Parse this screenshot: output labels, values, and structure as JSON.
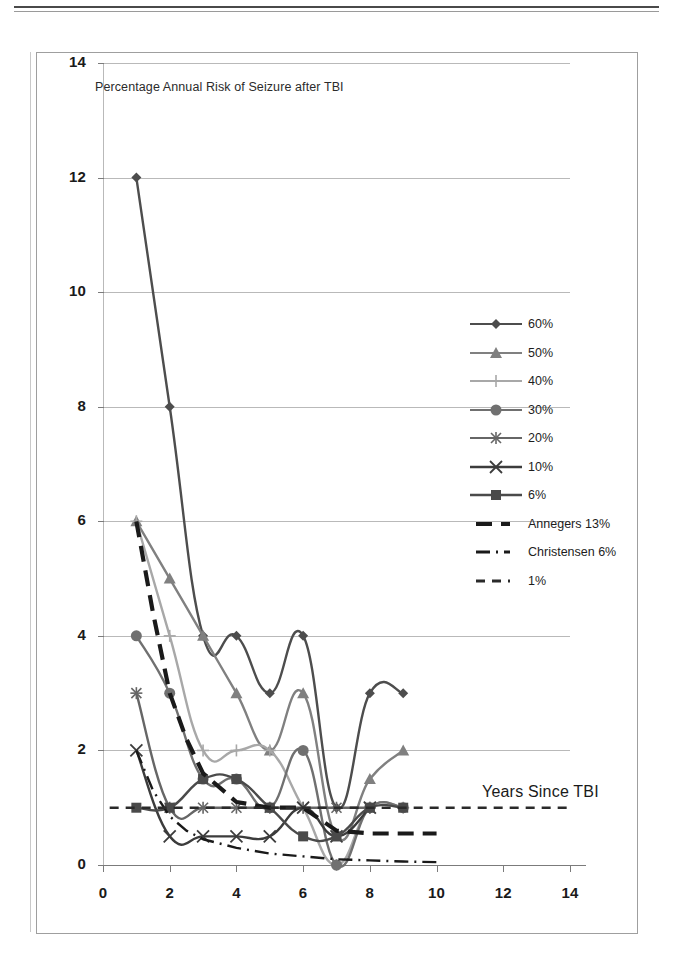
{
  "chart_data": {
    "type": "line",
    "title": "Percentage Annual Risk of Seizure after TBI",
    "xlabel": "Years Since TBI",
    "ylabel": "",
    "xlim": [
      0,
      14
    ],
    "ylim": [
      0,
      14
    ],
    "xticks": [
      "0",
      "2",
      "4",
      "6",
      "8",
      "10",
      "12",
      "14"
    ],
    "yticks": [
      "0",
      "2",
      "4",
      "6",
      "8",
      "10",
      "12",
      "14"
    ],
    "grid": "horizontal",
    "legend_position": "right-middle",
    "annotations": [
      "Years Since TBI"
    ],
    "x": [
      1,
      2,
      3,
      4,
      5,
      6,
      7,
      8,
      9,
      10
    ],
    "series": [
      {
        "name": "60%",
        "marker": "diamond",
        "color": "#4d4d4d",
        "x": [
          1,
          2,
          3,
          4,
          5,
          6,
          7,
          8,
          9
        ],
        "values": [
          12,
          8,
          4,
          4,
          3,
          4,
          1,
          3,
          3
        ]
      },
      {
        "name": "50%",
        "marker": "triangle",
        "color": "#808080",
        "x": [
          1,
          2,
          3,
          4,
          5,
          6,
          7,
          8,
          9
        ],
        "values": [
          6,
          5,
          4,
          3,
          2,
          3,
          0.5,
          1.5,
          2
        ]
      },
      {
        "name": "40%",
        "marker": "plus",
        "color": "#a8a8a8",
        "x": [
          1,
          2,
          3,
          4,
          5,
          6,
          7,
          8,
          9
        ],
        "values": [
          6,
          4,
          2,
          2,
          2,
          1,
          0,
          1,
          1
        ]
      },
      {
        "name": "30%",
        "marker": "circle",
        "color": "#707070",
        "x": [
          1,
          2,
          3,
          4,
          5,
          6,
          7,
          8,
          9
        ],
        "values": [
          4,
          3,
          1.5,
          1.5,
          1,
          2,
          0,
          1,
          1
        ]
      },
      {
        "name": "20%",
        "marker": "asterisk",
        "color": "#666666",
        "x": [
          1,
          2,
          3,
          4,
          5,
          6,
          7,
          8
        ],
        "values": [
          3,
          1,
          1,
          1,
          1,
          1,
          1,
          1
        ]
      },
      {
        "name": "10%",
        "marker": "x",
        "color": "#3c3c3c",
        "x": [
          1,
          2,
          3,
          4,
          5,
          6,
          7,
          8
        ],
        "values": [
          2,
          0.5,
          0.5,
          0.5,
          0.5,
          1,
          0.5,
          1
        ]
      },
      {
        "name": "6%",
        "marker": "square",
        "color": "#4a4a4a",
        "x": [
          1,
          2,
          3,
          4,
          5,
          6,
          7,
          8,
          9
        ],
        "values": [
          1,
          1,
          1.5,
          1.5,
          1,
          0.5,
          0.5,
          1,
          1
        ]
      },
      {
        "name": "Annegers 13%",
        "marker": "none",
        "style": "dashed-thick",
        "color": "#1a1a1a",
        "x": [
          1,
          1.5,
          2,
          2.5,
          3,
          4,
          5,
          6,
          7,
          8,
          9,
          10
        ],
        "values": [
          6,
          4.4,
          3.0,
          2.2,
          1.6,
          1.1,
          1.0,
          1.0,
          0.6,
          0.55,
          0.55,
          0.55
        ]
      },
      {
        "name": "Christensen 6%",
        "marker": "none",
        "style": "dash-dot",
        "color": "#1a1a1a",
        "x": [
          1,
          1.5,
          2,
          2.5,
          3,
          4,
          5,
          6,
          7,
          8,
          9,
          10
        ],
        "values": [
          2,
          1.3,
          0.85,
          0.6,
          0.45,
          0.3,
          0.2,
          0.15,
          0.1,
          0.08,
          0.06,
          0.05
        ]
      },
      {
        "name": "1%",
        "marker": "none",
        "style": "dotted",
        "color": "#2a2a2a",
        "x": [
          0.2,
          14
        ],
        "values": [
          1,
          1
        ]
      }
    ]
  },
  "legend": {
    "items": [
      {
        "label": "60%"
      },
      {
        "label": "50%"
      },
      {
        "label": "40%"
      },
      {
        "label": "30%"
      },
      {
        "label": "20%"
      },
      {
        "label": "10%"
      },
      {
        "label": "6%"
      },
      {
        "label": "Annegers 13%"
      },
      {
        "label": "Christensen 6%"
      },
      {
        "label": "1%"
      }
    ]
  },
  "axes": {
    "x_tick_labels": [
      "0",
      "2",
      "4",
      "6",
      "8",
      "10",
      "12",
      "14"
    ],
    "y_tick_labels": [
      "0",
      "2",
      "4",
      "6",
      "8",
      "10",
      "12",
      "14"
    ]
  },
  "colors": {
    "grid": "#b9b9b9",
    "axis": "#7b7b7b",
    "text": "#1a1a1a",
    "frame": "#9f9f9f"
  }
}
